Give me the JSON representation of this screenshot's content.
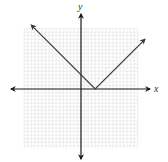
{
  "chart_data": {
    "type": "line",
    "title": "",
    "function": "y = |x - 2|",
    "xlabel": "x",
    "ylabel": "y",
    "xlim": [
      -8,
      8
    ],
    "ylim": [
      -8,
      8
    ],
    "grid": true,
    "legend": null,
    "series": [
      {
        "name": "y = |x - 2|",
        "points": [
          [
            -7,
            9
          ],
          [
            2,
            0
          ],
          [
            9,
            7
          ]
        ],
        "vertex": [
          2,
          0
        ],
        "y_intercept": 2,
        "arrows_both_ends": true
      }
    ],
    "ticks_labeled": false
  },
  "colors": {
    "axis": "#1a1a1a",
    "curve": "#3a3a3a",
    "grid": "#e2e2e2",
    "background": "#ffffff"
  },
  "layout": {
    "origin_px": [
      81,
      89
    ],
    "unit_px": 7.1,
    "grid_px": {
      "x0": 24,
      "x1": 138,
      "y0": 29,
      "y1": 148
    }
  }
}
